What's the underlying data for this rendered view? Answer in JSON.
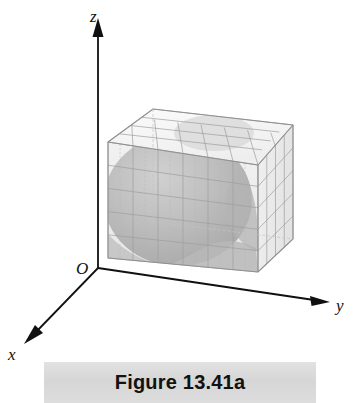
{
  "figure": {
    "caption": "Figure 13.41a",
    "caption_band_color": "#dcdcdc",
    "background_color": "#ffffff",
    "axis_color": "#101010",
    "grid_line_color": "#9a9a9a",
    "box_face_top_color": "#f2f2f2",
    "box_face_front_color": "#e9e9e9",
    "box_face_right_color": "#ededed",
    "solid_shade_color": "#b6b6b6",
    "solid_shade_dark_color": "#a2a2a2",
    "origin_label": "O",
    "axes": [
      {
        "name": "z-axis",
        "label": "z",
        "direction": "up",
        "arrow": "triangle"
      },
      {
        "name": "y-axis",
        "label": "y",
        "direction": "right-down",
        "arrow": "triangle"
      },
      {
        "name": "x-axis",
        "label": "x",
        "direction": "left-down",
        "arrow": "triangle"
      }
    ],
    "object": {
      "name": "gridded-rectangular-box",
      "description": "rectangular box partitioned into a grid of small cells",
      "grid_columns_front": 6,
      "grid_rows_front": 5,
      "grid_columns_top": 6,
      "grid_rows_top": 4,
      "grid_columns_right": 4,
      "grid_rows_right": 5,
      "contains": "shaded spherical solid"
    }
  }
}
